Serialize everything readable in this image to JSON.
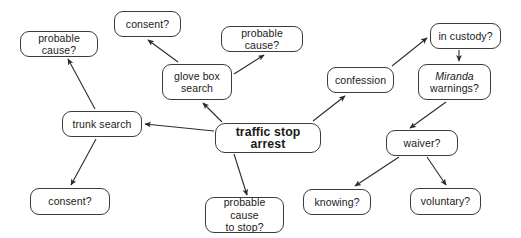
{
  "diagram": {
    "background_color": "#ffffff",
    "node_border_color": "#3c3c3c",
    "edge_color": "#2b2b2b",
    "text_color": "#1a1a1a",
    "nodes": [
      {
        "id": "probable-cause-trunk",
        "label": "probable cause?",
        "x": 20,
        "y": 31,
        "w": 78,
        "h": 26,
        "emphasis": "none"
      },
      {
        "id": "consent-glovebox",
        "label": "consent?",
        "x": 114,
        "y": 11,
        "w": 67,
        "h": 26,
        "emphasis": "none"
      },
      {
        "id": "probable-cause-glovebox",
        "label": "probable cause?",
        "x": 221,
        "y": 26,
        "w": 82,
        "h": 26,
        "emphasis": "none"
      },
      {
        "id": "glove-box-search",
        "label": "glove box\nsearch",
        "x": 162,
        "y": 64,
        "w": 70,
        "h": 36,
        "emphasis": "none"
      },
      {
        "id": "confession",
        "label": "confession",
        "x": 327,
        "y": 67,
        "w": 67,
        "h": 26,
        "emphasis": "none"
      },
      {
        "id": "in-custody",
        "label": "in custody?",
        "x": 430,
        "y": 23,
        "w": 71,
        "h": 26,
        "emphasis": "none"
      },
      {
        "id": "miranda-warnings",
        "label": "Miranda\nwarnings?",
        "x": 418,
        "y": 64,
        "w": 73,
        "h": 36,
        "emphasis": "italic-first-word"
      },
      {
        "id": "trunk-search",
        "label": "trunk search",
        "x": 62,
        "y": 111,
        "w": 80,
        "h": 26,
        "emphasis": "none"
      },
      {
        "id": "traffic-stop-arrest",
        "label": "traffic stop arrest",
        "x": 215,
        "y": 123,
        "w": 106,
        "h": 30,
        "emphasis": "bold"
      },
      {
        "id": "waiver",
        "label": "waiver?",
        "x": 386,
        "y": 130,
        "w": 72,
        "h": 26,
        "emphasis": "none"
      },
      {
        "id": "consent-trunk",
        "label": "consent?",
        "x": 30,
        "y": 188,
        "w": 80,
        "h": 27,
        "emphasis": "none"
      },
      {
        "id": "probable-cause-to-stop",
        "label": "probable cause\nto stop?",
        "x": 205,
        "y": 197,
        "w": 79,
        "h": 36,
        "emphasis": "none"
      },
      {
        "id": "knowing",
        "label": "knowing?",
        "x": 303,
        "y": 189,
        "w": 68,
        "h": 26,
        "emphasis": "none"
      },
      {
        "id": "voluntary",
        "label": "voluntary?",
        "x": 410,
        "y": 188,
        "w": 71,
        "h": 27,
        "emphasis": "none"
      }
    ],
    "edges": [
      {
        "id": "edge-arrest-trunk",
        "from": "traffic-stop-arrest",
        "to": "trunk-search",
        "x1": 214,
        "y1": 131,
        "x2": 145,
        "y2": 124,
        "arrow": true
      },
      {
        "id": "edge-arrest-glovebox",
        "from": "traffic-stop-arrest",
        "to": "glove-box-search",
        "x1": 222,
        "y1": 122,
        "x2": 203,
        "y2": 103,
        "arrow": true
      },
      {
        "id": "edge-arrest-probable-cause-stop",
        "from": "traffic-stop-arrest",
        "to": "probable-cause-to-stop",
        "x1": 234,
        "y1": 154,
        "x2": 247,
        "y2": 195,
        "arrow": true
      },
      {
        "id": "edge-arrest-confession",
        "from": "traffic-stop-arrest",
        "to": "confession",
        "x1": 313,
        "y1": 121,
        "x2": 345,
        "y2": 96,
        "arrow": true
      },
      {
        "id": "edge-trunk-probable-cause",
        "from": "trunk-search",
        "to": "probable-cause-trunk",
        "x1": 95,
        "y1": 109,
        "x2": 68,
        "y2": 59,
        "arrow": true
      },
      {
        "id": "edge-trunk-consent",
        "from": "trunk-search",
        "to": "consent-trunk",
        "x1": 96,
        "y1": 139,
        "x2": 71,
        "y2": 185,
        "arrow": true
      },
      {
        "id": "edge-glovebox-consent",
        "from": "glove-box-search",
        "to": "consent-glovebox",
        "x1": 178,
        "y1": 62,
        "x2": 148,
        "y2": 40,
        "arrow": true
      },
      {
        "id": "edge-glovebox-probable-cause",
        "from": "glove-box-search",
        "to": "probable-cause-glovebox",
        "x1": 234,
        "y1": 74,
        "x2": 264,
        "y2": 55,
        "arrow": true
      },
      {
        "id": "edge-confession-in-custody",
        "from": "confession",
        "to": "in-custody",
        "x1": 392,
        "y1": 66,
        "x2": 427,
        "y2": 38,
        "arrow": true
      },
      {
        "id": "edge-in-custody-miranda",
        "from": "in-custody",
        "to": "miranda-warnings",
        "x1": 459,
        "y1": 50,
        "x2": 459,
        "y2": 61,
        "arrow": true
      },
      {
        "id": "edge-miranda-waiver",
        "from": "miranda-warnings",
        "to": "waiver",
        "x1": 446,
        "y1": 102,
        "x2": 410,
        "y2": 128,
        "arrow": true
      },
      {
        "id": "edge-waiver-knowing",
        "from": "waiver",
        "to": "knowing",
        "x1": 399,
        "y1": 157,
        "x2": 355,
        "y2": 186,
        "arrow": true
      },
      {
        "id": "edge-waiver-voluntary",
        "from": "waiver",
        "to": "voluntary",
        "x1": 427,
        "y1": 157,
        "x2": 446,
        "y2": 185,
        "arrow": true
      }
    ]
  }
}
